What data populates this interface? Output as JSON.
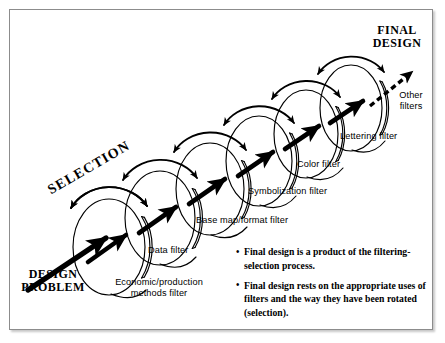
{
  "figure": {
    "start_label": "DESIGN\nPROBLEM",
    "end_label": "FINAL\nDESIGN",
    "rotation_label": "SELECTION",
    "colors": {
      "ink": "#000000",
      "frame": "#8c8c8c",
      "background": "#ffffff"
    },
    "filters": [
      {
        "id": "economic",
        "label": "Economic/production\nmethods filter"
      },
      {
        "id": "data",
        "label": "Data filter"
      },
      {
        "id": "basemap",
        "label": "Base map/format filter"
      },
      {
        "id": "symbolization",
        "label": "Symbolization filter"
      },
      {
        "id": "color",
        "label": "Color filter"
      },
      {
        "id": "lettering",
        "label": "Lettering filter"
      },
      {
        "id": "other",
        "label": "Other\nfilters"
      }
    ],
    "notes": [
      {
        "bullet": "•",
        "text": "Final design is a product of the filtering-selection process."
      },
      {
        "bullet": "•",
        "text": "Final design rests on the appropriate uses of filters and the way they have been rotated (selection)."
      }
    ]
  }
}
